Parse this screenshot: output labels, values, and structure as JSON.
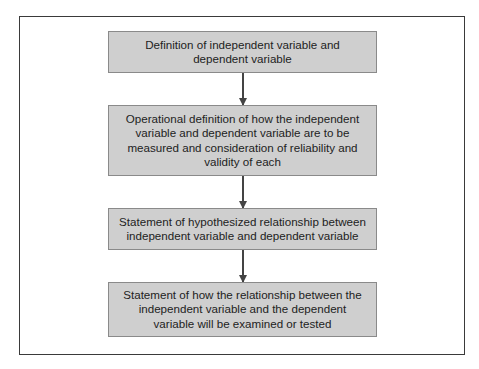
{
  "diagram": {
    "type": "flowchart",
    "direction": "top-to-bottom",
    "colors": {
      "box_fill": "#cfcfcf",
      "box_border": "#8a8a8a",
      "frame": "#3a3a3a",
      "arrow": "#444444"
    },
    "steps": [
      {
        "label": "Definition of independent variable and dependent variable"
      },
      {
        "label": "Operational definition of how the independent variable and dependent variable are to be measured and consideration of reliability and validity of each"
      },
      {
        "label": "Statement of hypothesized relationship between independent variable and dependent variable"
      },
      {
        "label": "Statement of how the relationship between the independent variable and the dependent variable will be examined or tested"
      }
    ],
    "arrows": [
      {
        "from": 0,
        "to": 1
      },
      {
        "from": 1,
        "to": 2
      },
      {
        "from": 2,
        "to": 3
      }
    ]
  }
}
